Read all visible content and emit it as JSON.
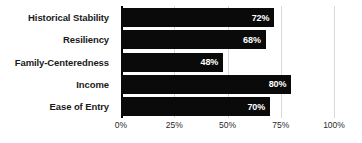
{
  "chart_data": {
    "type": "bar",
    "orientation": "horizontal",
    "title": "",
    "xlabel": "",
    "ylabel": "",
    "categories": [
      "Historical Stability",
      "Resiliency",
      "Family-Centeredness",
      "Income",
      "Ease of Entry"
    ],
    "values": [
      72,
      68,
      48,
      80,
      70
    ],
    "data_labels": [
      "72%",
      "68%",
      "48%",
      "80%",
      "70%"
    ],
    "xlim": [
      0,
      100
    ],
    "xticks": [
      0,
      25,
      50,
      75,
      100
    ],
    "xtick_labels": [
      "0%",
      "25%",
      "50%",
      "75%",
      "100%"
    ],
    "grid": true,
    "grid_axis": "x",
    "legend": false,
    "bar_color": "#0a0a0a",
    "label_color": "#ffffff",
    "grid_color": "#d9d9d9",
    "axis_color": "#000000",
    "background_color": "#ffffff"
  }
}
